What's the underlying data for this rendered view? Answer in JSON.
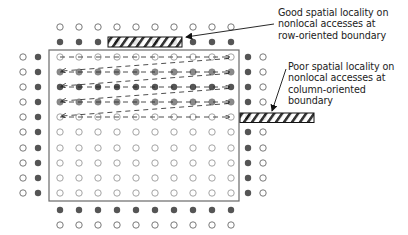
{
  "diagram": {
    "colors": {
      "open_stroke": "#6a6a6a",
      "filled_dark": "#555555",
      "filled_medium": "#8a8a8a",
      "box_stroke": "#666666",
      "hatch": "#111111",
      "arrow": "#222222"
    },
    "grid": {
      "inner_columns": 10,
      "inner_rows": 10,
      "accessed_rows": 5,
      "outer_ghost_layers": 2
    },
    "annotations": {
      "good": {
        "lines": [
          "Good spatial locality on",
          "nonlocal accesses at",
          "row-oriented boundary"
        ]
      },
      "poor": {
        "lines": [
          "Poor spatial locality on",
          "nonlocal accesses at",
          "column-oriented",
          "boundary"
        ]
      }
    }
  }
}
